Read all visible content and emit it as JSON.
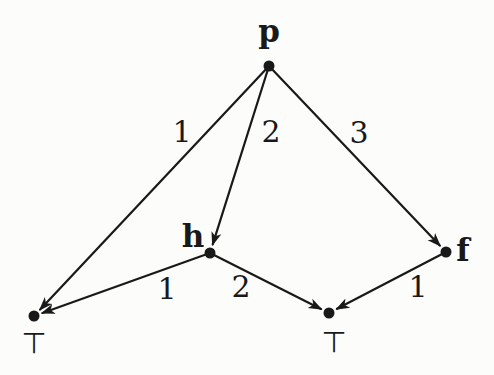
{
  "figure": {
    "type": "weighted-directed-graph",
    "background_color": "#fcfcfa",
    "ink_color": "#191919",
    "node_dot_radius": 5.5,
    "edge_stroke_width": 2.2
  },
  "graph": {
    "nodes": [
      {
        "id": "p",
        "label": "p",
        "x": 269,
        "y": 66,
        "label_x": 269,
        "label_y": 42,
        "label_style": "bold-serif"
      },
      {
        "id": "h",
        "label": "h",
        "x": 210,
        "y": 253,
        "label_x": 193,
        "label_y": 247,
        "label_style": "bold-serif"
      },
      {
        "id": "f",
        "label": "f",
        "x": 446,
        "y": 252,
        "label_x": 463,
        "label_y": 261,
        "label_style": "bold-serif"
      },
      {
        "id": "top-left",
        "label": "⊤",
        "x": 34,
        "y": 316,
        "label_x": 34,
        "label_y": 353,
        "label_style": "sans"
      },
      {
        "id": "top-right",
        "label": "⊤",
        "x": 329,
        "y": 313,
        "label_x": 334,
        "label_y": 352,
        "label_style": "sans"
      }
    ],
    "edges": [
      {
        "from": "p",
        "to": "top-left",
        "weight": "1",
        "label_x": 182,
        "label_y": 142
      },
      {
        "from": "p",
        "to": "h",
        "weight": "2",
        "label_x": 271,
        "label_y": 142
      },
      {
        "from": "p",
        "to": "f",
        "weight": "3",
        "label_x": 359,
        "label_y": 143
      },
      {
        "from": "h",
        "to": "top-left",
        "weight": "1",
        "label_x": 167,
        "label_y": 299
      },
      {
        "from": "h",
        "to": "top-right",
        "weight": "2",
        "label_x": 241,
        "label_y": 297
      },
      {
        "from": "f",
        "to": "top-right",
        "weight": "1",
        "label_x": 418,
        "label_y": 297
      }
    ]
  }
}
